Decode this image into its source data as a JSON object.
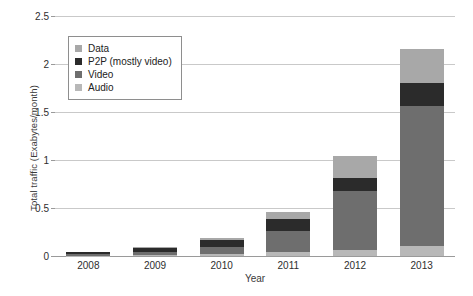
{
  "chart_data": {
    "type": "bar",
    "subtype": "stacked-bar",
    "title": "",
    "xlabel": "Year",
    "ylabel": "Total traffic (Exabytes/month)",
    "categories": [
      "2008",
      "2009",
      "2010",
      "2011",
      "2012",
      "2013"
    ],
    "ylim": [
      0,
      2.5
    ],
    "yticks": [
      "0",
      "0.5",
      "1",
      "1.5",
      "2",
      "2.5"
    ],
    "ytick_values": [
      0,
      0.5,
      1,
      1.5,
      2,
      2.5
    ],
    "grid": true,
    "grid_axis": "y",
    "legend_position": "upper-left-inside",
    "stack_order_bottom_to_top": [
      "Audio",
      "Video",
      "P2P (mostly video)",
      "Data"
    ],
    "series": [
      {
        "name": "Audio",
        "color": "#b8b8b8",
        "values": [
          0.005,
          0.012,
          0.022,
          0.04,
          0.06,
          0.1
        ]
      },
      {
        "name": "Video",
        "color": "#6e6e6e",
        "values": [
          0.012,
          0.03,
          0.075,
          0.22,
          0.62,
          1.46
        ]
      },
      {
        "name": "P2P (mostly video)",
        "color": "#2b2b2b",
        "values": [
          0.02,
          0.04,
          0.07,
          0.13,
          0.13,
          0.24
        ]
      },
      {
        "name": "Data",
        "color": "#a8a8a8",
        "values": [
          0.005,
          0.01,
          0.02,
          0.07,
          0.23,
          0.36
        ]
      }
    ],
    "totals": [
      0.04,
      0.09,
      0.19,
      0.46,
      1.04,
      2.16
    ]
  },
  "legend": {
    "items": [
      {
        "label": "Data",
        "color": "#a8a8a8"
      },
      {
        "label": "P2P (mostly video)",
        "color": "#2b2b2b"
      },
      {
        "label": "Video",
        "color": "#6e6e6e"
      },
      {
        "label": "Audio",
        "color": "#b8b8b8"
      }
    ]
  },
  "colors": {
    "background": "#ffffff",
    "gridline": "#c9c9c9",
    "axis": "#9a9a9a",
    "text": "#222222"
  }
}
